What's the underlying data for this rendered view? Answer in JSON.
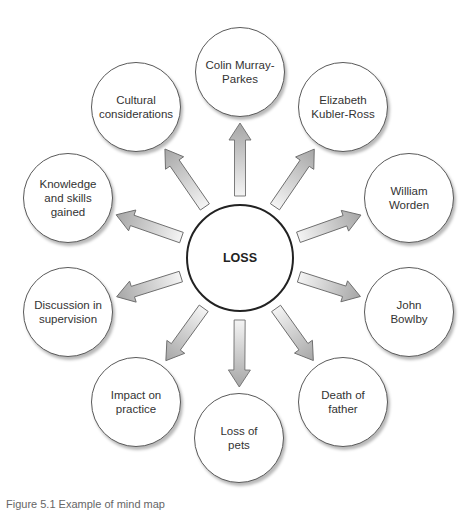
{
  "diagram": {
    "type": "mind-map",
    "center": {
      "label": "LOSS",
      "x": 240,
      "y": 258,
      "r": 54
    },
    "node_radius": 45,
    "nodes": [
      {
        "label": "Colin Murray-\nParkes",
        "x": 240,
        "y": 72
      },
      {
        "label": "Elizabeth\nKubler-Ross",
        "x": 343,
        "y": 107
      },
      {
        "label": "William\nWorden",
        "x": 409,
        "y": 198
      },
      {
        "label": "John\nBowlby",
        "x": 409,
        "y": 312
      },
      {
        "label": "Death of\nfather",
        "x": 343,
        "y": 402
      },
      {
        "label": "Loss of\npets",
        "x": 239,
        "y": 438
      },
      {
        "label": "Impact on\npractice",
        "x": 136,
        "y": 402
      },
      {
        "label": "Discussion in\nsupervision",
        "x": 68,
        "y": 312
      },
      {
        "label": "Knowledge\nand skills\ngained",
        "x": 68,
        "y": 198
      },
      {
        "label": "Cultural\nconsiderations",
        "x": 136,
        "y": 107
      }
    ],
    "colors": {
      "arrow_light": "#f4f4f4",
      "arrow_dark": "#a6a6a6",
      "arrow_stroke": "#6e6e6e",
      "node_border": "#5a5a5a",
      "center_border": "#222222"
    }
  },
  "caption": "Figure 5.1  Example of mind map"
}
